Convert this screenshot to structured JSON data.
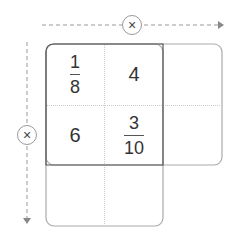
{
  "operators": {
    "top": "×",
    "left": "×"
  },
  "grid": {
    "cells": [
      {
        "row": 0,
        "col": 0,
        "type": "fraction",
        "numerator": "1",
        "denominator": "8"
      },
      {
        "row": 0,
        "col": 1,
        "type": "number",
        "value": "4"
      },
      {
        "row": 1,
        "col": 0,
        "type": "number",
        "value": "6"
      },
      {
        "row": 1,
        "col": 1,
        "type": "fraction",
        "numerator": "3",
        "denominator": "10"
      }
    ],
    "empty_cells": [
      {
        "row": 0,
        "col": 2
      },
      {
        "row": 1,
        "col": 2
      },
      {
        "row": 2,
        "col": 0
      },
      {
        "row": 2,
        "col": 1
      }
    ]
  },
  "colors": {
    "dark_border": "#555555",
    "light_border": "#aaaaaa",
    "dotted_line": "#cccccc",
    "arrow": "#999999"
  }
}
